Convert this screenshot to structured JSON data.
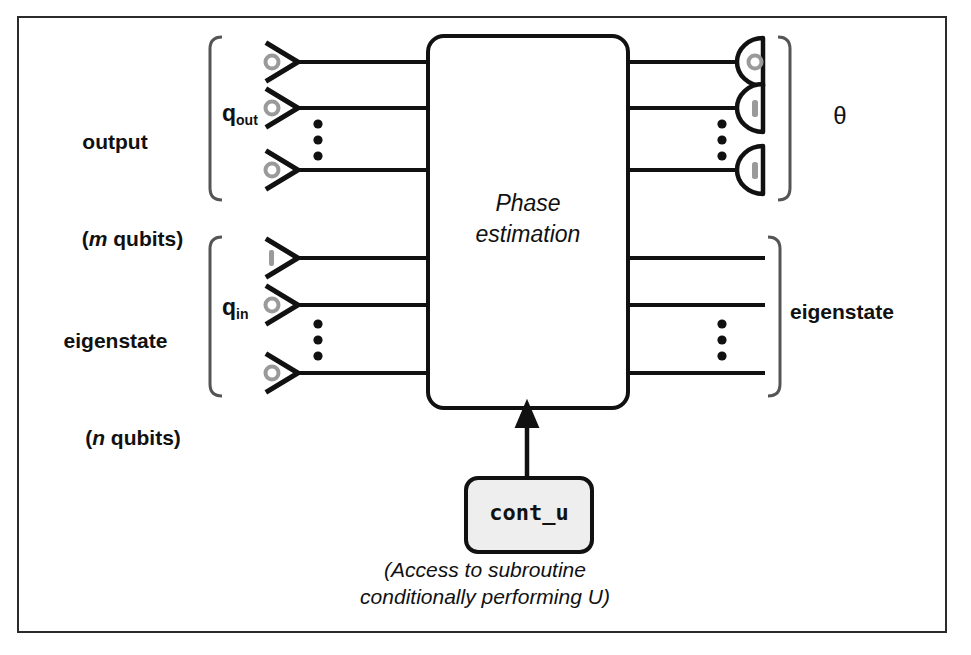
{
  "figure": {
    "type": "quantum-circuit-diagram",
    "title_in_box": [
      "Phase",
      "estimation"
    ],
    "caption": [
      "(Access to subroutine",
      "conditionally performing U)"
    ],
    "border_color": "#2b2b2b",
    "wire_color": "#111111",
    "box_fill": "#ffffff",
    "subroutine_box_fill": "#eeeeee",
    "ket_marker_color": "#999999"
  },
  "left_groups": [
    {
      "name": "output-group",
      "label_line1": "output",
      "label_italic": "m",
      "label_line2_prefix": "(",
      "label_line2_suffix": " qubits)",
      "register": "q",
      "register_sub": "out",
      "qubit_states": [
        "0",
        "0",
        "0"
      ],
      "ellipsis": true
    },
    {
      "name": "eigenstate-group",
      "label_line1": "eigenstate",
      "label_italic": "n",
      "label_line2_prefix": "(",
      "label_line2_suffix": " qubits)",
      "register": "q",
      "register_sub": "in",
      "qubit_states": [
        "1",
        "0",
        "0"
      ],
      "ellipsis": true
    }
  ],
  "gate": {
    "name": "phase-estimation-gate",
    "label": "Phase estimation",
    "label_line1": "Phase",
    "label_line2": "estimation"
  },
  "subroutine": {
    "name": "cont_u-block",
    "label": "cont_u"
  },
  "right_outputs": {
    "measurements": {
      "name": "measurement-detectors",
      "results": [
        "0",
        "1",
        "1"
      ],
      "ellipsis": true,
      "result_label": "θ"
    },
    "eigenstate": {
      "name": "eigenstate-output",
      "label": "eigenstate"
    }
  },
  "wires": {
    "output_rows_y": [
      62,
      108,
      170
    ],
    "eigen_rows_y": [
      258,
      305,
      373
    ]
  }
}
